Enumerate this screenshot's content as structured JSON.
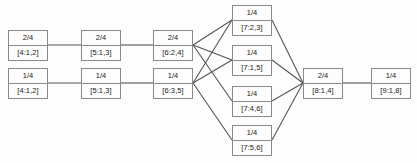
{
  "diagram": {
    "node_border_color": "#8a8a8a",
    "edge_color": "#555555",
    "background_color": "#fdfdfd",
    "nodes": [
      {
        "id": "n1",
        "top": "2/4",
        "bottom": "[4:1,2]",
        "x": 8,
        "y": 30,
        "column": 1,
        "row": 1
      },
      {
        "id": "n2",
        "top": "1/4",
        "bottom": "[4:1,2]",
        "x": 8,
        "y": 68,
        "column": 1,
        "row": 2
      },
      {
        "id": "n3",
        "top": "2/4",
        "bottom": "[5:1,3]",
        "x": 81,
        "y": 30,
        "column": 2,
        "row": 1
      },
      {
        "id": "n4",
        "top": "1/4",
        "bottom": "[5:1,3]",
        "x": 81,
        "y": 68,
        "column": 2,
        "row": 2
      },
      {
        "id": "n5",
        "top": "2/4",
        "bottom": "[6:2,4]",
        "x": 153,
        "y": 30,
        "column": 3,
        "row": 1
      },
      {
        "id": "n6",
        "top": "1/4",
        "bottom": "[6:3,5]",
        "x": 153,
        "y": 68,
        "column": 3,
        "row": 2
      },
      {
        "id": "n7",
        "top": "1/4",
        "bottom": "[7:2,3]",
        "x": 232,
        "y": 5,
        "column": 4,
        "row": 1
      },
      {
        "id": "n8",
        "top": "1/4",
        "bottom": "[7:1,5]",
        "x": 232,
        "y": 45,
        "column": 4,
        "row": 2
      },
      {
        "id": "n9",
        "top": "1/4",
        "bottom": "[7:4,6]",
        "x": 232,
        "y": 86,
        "column": 4,
        "row": 3
      },
      {
        "id": "n10",
        "top": "1/4",
        "bottom": "[7:5,6]",
        "x": 232,
        "y": 125,
        "column": 4,
        "row": 4
      },
      {
        "id": "n11",
        "top": "2/4",
        "bottom": "[8:1,4]",
        "x": 303,
        "y": 68,
        "column": 5,
        "row": 1
      },
      {
        "id": "n12",
        "top": "1/4",
        "bottom": "[9:1,8]",
        "x": 371,
        "y": 68,
        "column": 6,
        "row": 1
      }
    ],
    "edges": [
      {
        "from": "n1",
        "to": "n3",
        "x1": 48,
        "y1": 45,
        "x2": 81,
        "y2": 45
      },
      {
        "from": "n2",
        "to": "n4",
        "x1": 48,
        "y1": 83,
        "x2": 81,
        "y2": 83
      },
      {
        "from": "n3",
        "to": "n5",
        "x1": 121,
        "y1": 45,
        "x2": 153,
        "y2": 45
      },
      {
        "from": "n4",
        "to": "n6",
        "x1": 121,
        "y1": 83,
        "x2": 153,
        "y2": 83
      },
      {
        "from": "n5",
        "to": "n7",
        "x1": 193,
        "y1": 45,
        "x2": 232,
        "y2": 20
      },
      {
        "from": "n5",
        "to": "n8",
        "x1": 193,
        "y1": 45,
        "x2": 232,
        "y2": 60
      },
      {
        "from": "n5",
        "to": "n9",
        "x1": 193,
        "y1": 45,
        "x2": 232,
        "y2": 101
      },
      {
        "from": "n6",
        "to": "n7",
        "x1": 193,
        "y1": 83,
        "x2": 232,
        "y2": 20
      },
      {
        "from": "n6",
        "to": "n8",
        "x1": 193,
        "y1": 83,
        "x2": 232,
        "y2": 60
      },
      {
        "from": "n6",
        "to": "n10",
        "x1": 193,
        "y1": 83,
        "x2": 232,
        "y2": 140
      },
      {
        "from": "n7",
        "to": "n11",
        "x1": 272,
        "y1": 20,
        "x2": 303,
        "y2": 83
      },
      {
        "from": "n8",
        "to": "n11",
        "x1": 272,
        "y1": 60,
        "x2": 303,
        "y2": 83
      },
      {
        "from": "n9",
        "to": "n11",
        "x1": 272,
        "y1": 101,
        "x2": 303,
        "y2": 83
      },
      {
        "from": "n10",
        "to": "n11",
        "x1": 272,
        "y1": 140,
        "x2": 303,
        "y2": 83
      },
      {
        "from": "n11",
        "to": "n12",
        "x1": 343,
        "y1": 83,
        "x2": 371,
        "y2": 83
      }
    ]
  }
}
